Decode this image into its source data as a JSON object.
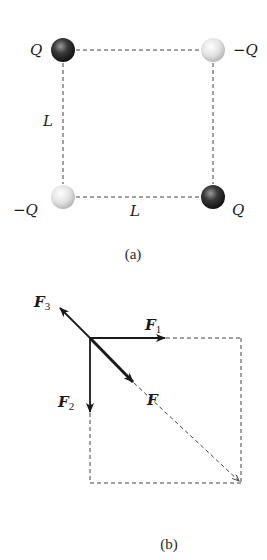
{
  "figure_a": {
    "caption": "(a)",
    "charges": [
      {
        "position": "top-left",
        "label": "Q",
        "sign": "positive",
        "color": "#2a2a2a"
      },
      {
        "position": "top-right",
        "label": "−Q",
        "sign": "negative",
        "color": "#d8d8d8"
      },
      {
        "position": "bottom-left",
        "label": "−Q",
        "sign": "negative",
        "color": "#d8d8d8"
      },
      {
        "position": "bottom-right",
        "label": "Q",
        "sign": "positive",
        "color": "#2a2a2a"
      }
    ],
    "side_labels": {
      "left": "L",
      "bottom": "L"
    }
  },
  "figure_b": {
    "caption": "(b)",
    "vectors": [
      {
        "name": "F1",
        "label_main": "F",
        "label_sub": "1",
        "direction": "right"
      },
      {
        "name": "F2",
        "label_main": "F",
        "label_sub": "2",
        "direction": "down"
      },
      {
        "name": "F3",
        "label_main": "F",
        "label_sub": "3",
        "direction": "up-left"
      },
      {
        "name": "F",
        "label_main": "F",
        "label_sub": "",
        "direction": "down-right"
      }
    ]
  },
  "colors": {
    "positive_charge": "#2a2a2a",
    "negative_charge": "#d8d8d8",
    "line": "#1a1a1a",
    "dash": "#444444"
  }
}
